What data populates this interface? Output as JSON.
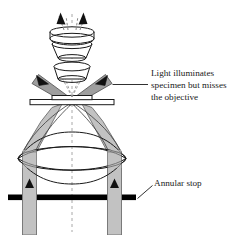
{
  "figure": {
    "background_color": "#ffffff",
    "beam_fill_color": "#c2c2c2",
    "beam_edge_color": "#6e6e6e",
    "outline_color": "#1a1a1a",
    "stop_color": "#000000",
    "axis_color": "#9a9a9a"
  },
  "annotations": [
    {
      "name": "light-misses-objective",
      "lines": [
        "Light illuminates",
        "specimen but misses",
        "the objective"
      ],
      "leader": "horizontal"
    },
    {
      "name": "annular-stop",
      "lines": [
        "Annular stop"
      ],
      "leader": "diagonal"
    }
  ],
  "components": [
    {
      "name": "eyepiece-lens",
      "label": ""
    },
    {
      "name": "intermediate-lens",
      "label": ""
    },
    {
      "name": "objective-lens",
      "label": ""
    },
    {
      "name": "specimen-slide",
      "label": ""
    },
    {
      "name": "coverslip",
      "label": ""
    },
    {
      "name": "condenser-lens",
      "label": ""
    },
    {
      "name": "annular-stop-bar",
      "label": ""
    },
    {
      "name": "optical-axis",
      "label": ""
    }
  ],
  "rays": {
    "up_arrow_count": 2,
    "oblique_arrow_count": 2,
    "source_arrow_count": 2,
    "style": "dashed-center-axis"
  }
}
